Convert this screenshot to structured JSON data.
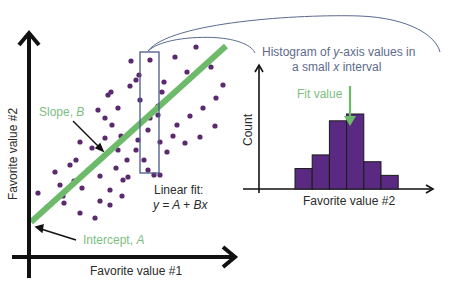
{
  "colors": {
    "axis": "#111111",
    "dot": "#5b2a6e",
    "fit_line": "#6dbb6a",
    "interval_box": "#4a5a88",
    "arc": "#5a6a90",
    "histogram_bar": "#5a2a82",
    "histogram_edge": "#1a1a1a",
    "green_text": "#7cc07f",
    "blue_text": "#5d6b8c"
  },
  "scatter": {
    "x_axis_label": "Favorite value #1",
    "y_axis_label": "Favorite value #2",
    "slope_label": "Slope, ",
    "slope_symbol": "B",
    "intercept_label": "Intercept, ",
    "intercept_symbol": "A",
    "fit_title": "Linear fit:",
    "fit_equation": "y = A + Bx"
  },
  "histogram": {
    "title_line1_pre": "Histogram of ",
    "title_line1_var": "y",
    "title_line1_post": "-axis values in",
    "title_line2_pre": "a small ",
    "title_line2_var": "x",
    "title_line2_post": " interval",
    "fit_value_label": "Fit value",
    "x_axis_label": "Favorite value #2",
    "y_axis_label": "Count"
  },
  "chart_data": [
    {
      "type": "scatter",
      "title": "",
      "xlabel": "Favorite value #1",
      "ylabel": "Favorite value #2",
      "fit": {
        "type": "linear",
        "equation": "y = A + Bx",
        "intercept_label": "Intercept, A",
        "slope_label": "Slope, B"
      },
      "points_px": [
        [
          80,
          142
        ],
        [
          92,
          148
        ],
        [
          105,
          138
        ],
        [
          76,
          160
        ],
        [
          88,
          170
        ],
        [
          100,
          176
        ],
        [
          118,
          150
        ],
        [
          116,
          168
        ],
        [
          127,
          160
        ],
        [
          123,
          180
        ],
        [
          112,
          125
        ],
        [
          105,
          118
        ],
        [
          98,
          110
        ],
        [
          108,
          95
        ],
        [
          118,
          108
        ],
        [
          121,
          136
        ],
        [
          130,
          86
        ],
        [
          136,
          80
        ],
        [
          140,
          100
        ],
        [
          150,
          118
        ],
        [
          138,
          140
        ],
        [
          148,
          130
        ],
        [
          136,
          150
        ],
        [
          144,
          160
        ],
        [
          148,
          170
        ],
        [
          160,
          175
        ],
        [
          167,
          152
        ],
        [
          173,
          136
        ],
        [
          160,
          142
        ],
        [
          158,
          106
        ],
        [
          162,
          92
        ],
        [
          158,
          115
        ],
        [
          164,
          82
        ],
        [
          175,
          57
        ],
        [
          187,
          72
        ],
        [
          196,
          47
        ],
        [
          211,
          67
        ],
        [
          223,
          85
        ],
        [
          177,
          125
        ],
        [
          190,
          116
        ],
        [
          203,
          108
        ],
        [
          216,
          98
        ],
        [
          215,
          126
        ],
        [
          200,
          137
        ],
        [
          185,
          143
        ],
        [
          131,
          61
        ],
        [
          139,
          75
        ],
        [
          150,
          60
        ],
        [
          111,
          92
        ],
        [
          154,
          175
        ],
        [
          38,
          193
        ],
        [
          60,
          185
        ],
        [
          70,
          165
        ],
        [
          55,
          172
        ],
        [
          64,
          203
        ],
        [
          47,
          207
        ],
        [
          82,
          188
        ],
        [
          110,
          190
        ],
        [
          100,
          201
        ],
        [
          122,
          196
        ],
        [
          80,
          213
        ],
        [
          95,
          218
        ],
        [
          110,
          205
        ],
        [
          128,
          177
        ],
        [
          63,
          196
        ],
        [
          74,
          181
        ]
      ],
      "fit_line_px": [
        [
          31,
          222
        ],
        [
          226,
          46
        ]
      ],
      "interval_box_px": {
        "x0": 140,
        "x1": 159,
        "y0": 52,
        "y1": 173
      }
    },
    {
      "type": "bar",
      "title": "Histogram of y-axis values in a small x interval",
      "xlabel": "Favorite value #2",
      "ylabel": "Count",
      "categories": [
        "bin1",
        "bin2",
        "bin3",
        "bin4",
        "bin5",
        "bin6"
      ],
      "values": [
        3,
        5,
        10,
        11,
        4,
        2
      ],
      "annotation": "Fit value (arrow at bin4)"
    }
  ]
}
